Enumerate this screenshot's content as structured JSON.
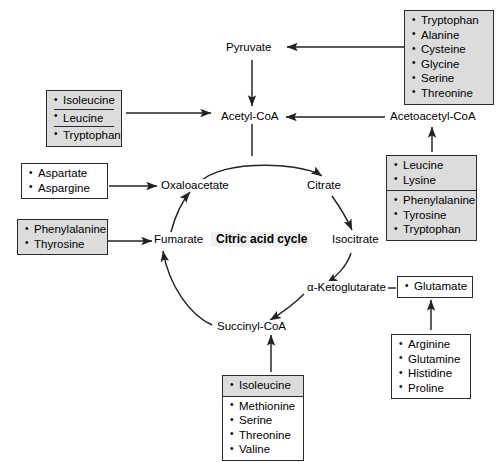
{
  "diagram": {
    "center_label": "Citric acid cycle",
    "nodes": {
      "pyruvate": "Pyruvate",
      "acetyl_coa": "Acetyl-CoA",
      "acetoacetyl_coa": "Acetoacetyl-CoA",
      "oxaloacetate": "Oxaloacetate",
      "citrate": "Citrate",
      "isocitrate": "Isocitrate",
      "alpha_ketoglutarate": "α-Ketoglutarate",
      "succinyl_coa": "Succinyl-CoA",
      "fumarate": "Fumarate"
    },
    "boxes": {
      "to_pyruvate": {
        "target": "Pyruvate",
        "shaded": true,
        "items": [
          "Tryptophan",
          "Alanine",
          "Cysteine",
          "Glycine",
          "Serine",
          "Threonine"
        ]
      },
      "to_acetyl_coa": {
        "target": "Acetyl-CoA",
        "shaded": true,
        "items": [
          "Isoleucine",
          "Leucine",
          "Tryptophan"
        ]
      },
      "to_acetoacetyl_coa_top": {
        "target": "Acetoacetyl-CoA",
        "shaded": true,
        "items": [
          "Leucine",
          "Lysine"
        ]
      },
      "to_acetoacetyl_coa_bottom": {
        "target": "Acetoacetyl-CoA",
        "shaded": true,
        "items": [
          "Phenylalanine",
          "Tyrosine",
          "Tryptophan"
        ]
      },
      "to_oxaloacetate": {
        "target": "Oxaloacetate",
        "shaded": false,
        "items": [
          "Aspartate",
          "Aspargine"
        ]
      },
      "to_fumarate": {
        "target": "Fumarate",
        "shaded": true,
        "items": [
          "Phenylalanine",
          "Thyrosine"
        ]
      },
      "to_alpha_ketoglutarate_direct": {
        "target": "α-Ketoglutarate",
        "shaded": false,
        "items": [
          "Glutamate"
        ]
      },
      "to_glutamate": {
        "target": "Glutamate",
        "shaded": false,
        "items": [
          "Arginine",
          "Glutamine",
          "Histidine",
          "Proline"
        ]
      },
      "to_succinyl_coa_top": {
        "target": "Succinyl-CoA",
        "shaded": true,
        "items": [
          "Isoleucine"
        ]
      },
      "to_succinyl_coa_bottom": {
        "target": "Succinyl-CoA",
        "shaded": false,
        "items": [
          "Methionine",
          "Serine",
          "Threonine",
          "Valine"
        ]
      }
    }
  },
  "colors": {
    "stroke": "#2b2b2b",
    "shade": "#dcdcdc",
    "center_bg": "#f2f2f2",
    "background": "#ffffff"
  }
}
